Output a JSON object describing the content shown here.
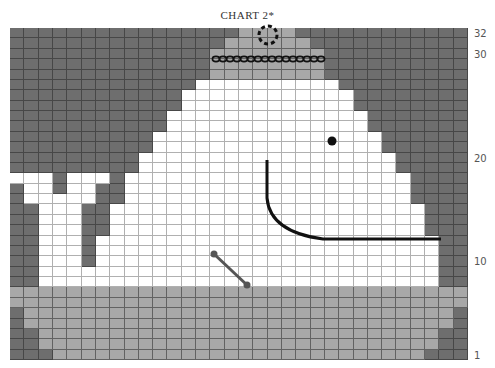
{
  "title": "CHART 2*",
  "chart_data": {
    "type": "knitting-chart",
    "title": "CHART 2*",
    "columns": 32,
    "rows": 32,
    "row_labels": [
      {
        "label": "32",
        "row": 32
      },
      {
        "label": "30",
        "row": 30
      },
      {
        "label": "20",
        "row": 20
      },
      {
        "label": "10",
        "row": 10
      },
      {
        "label": "1",
        "row": 1
      }
    ],
    "legend_colors": {
      "D": "#6e6e6e",
      "L": "#a8a8a8",
      "W": "#ffffff"
    },
    "grid_rows_top_to_bottom": [
      "DDDDDDDDDDDDDDDDLLLLDDDDDDDDDDDD",
      "DDDDDDDDDDDDDDDLLLLLLDDDDDDDDDDD",
      "DDDDDDDDDDDDDDLLLLLLLLDDDDDDDDDD",
      "DDDDDDDDDDDDDDLLLLLLLLDDDDDDDDDD",
      "DDDDDDDDDDDDDDLLLLLLLLDDDDDDDDDD",
      "DDDDDDDDDDDDDWWWWWWWWWWDDDDDDDDD",
      "DDDDDDDDDDDDWWWWWWWWWWWWDDDDDDDD",
      "DDDDDDDDDDDDWWWWWWWWWWWWDDDDDDDD",
      "DDDDDDDDDDDWWWWWWWWWWWWWWDDDDDDD",
      "DDDDDDDDDDDWWWWWWWWWWWWWWDDDDDDD",
      "DDDDDDDDDDWWWWWWWWWWWWWWWWDDDDDD",
      "DDDDDDDDDDWWWWWWWWWWWWWWWWDDDDDD",
      "DDDDDDDDDWWWWWWWWWWWWWWWWWWDDDDD",
      "DDDDDDDDDWWWWWWWWWWWWWWWWWWDDDDD",
      "WWWDWWWDWWWWWWWWWWWWWWWWWWWWDDDD",
      "DWWDWWDDWWWWWWWWWWWWWWWWWWWWDDDD",
      "DWWWWWDDWWWWWWWWWWWWWWWWWWWWDDDD",
      "DDWWWDDWWWWWWWWWWWWWWWWWWWWWWDDD",
      "DDWWWDDWWWWWWWWWWWWWWWWWWWWWWDDD",
      "DDWWWDDWWWWWWWWWWWWWWWWWWWWWWDDD",
      "DDWWWDWWWWWWWWWWWWWWWWWWWWWWWWDD",
      "DDWWWDWWWWWWWWWWWWWWWWWWWWWWWWDD",
      "DDWWWDWWWWWWWWWWWWWWWWWWWWWWWWDD",
      "DDWWWWWWWWWWWWWWWWWWWWWWWWWWWWDD",
      "DDWWWWWWWWWWWWWWWWWWWWWWWWWWWWDD",
      "LLLLLLLLLLLLLLLLLLLLLLLLLLLLLLLL",
      "LLLLLLLLLLLLLLLLLLLLLLLLLLLLLLLL",
      "DLLLLLLLLLLLLLLLLLLLLLLLLLLLLLLD",
      "DLLLLLLLLLLLLLLLLLLLLLLLLLLLLLLD",
      "DDLLLLLLLLLLLLLLLLLLLLLLLLLLLLDD",
      "DDLLLLLLLLLLLLLLLLLLLLLLLLLLLLDD",
      "DDDLLLLLLLLLLLLLLLLLLLLLLLLLLDDD"
    ],
    "annotations": [
      {
        "name": "dashed-circle",
        "cx": 268,
        "cy": 35,
        "r": 9
      },
      {
        "name": "chain-stitch-line",
        "x1": 213,
        "x2": 323,
        "y": 59
      },
      {
        "name": "eye-dot",
        "cx": 332,
        "cy": 141,
        "r": 4.5
      },
      {
        "name": "mouth-line",
        "path": "M267 160 L267 198 Q270 232 323 239 L441 239"
      },
      {
        "name": "bone-line",
        "x1": 214,
        "y1": 254,
        "x2": 247,
        "y2": 285
      }
    ]
  }
}
